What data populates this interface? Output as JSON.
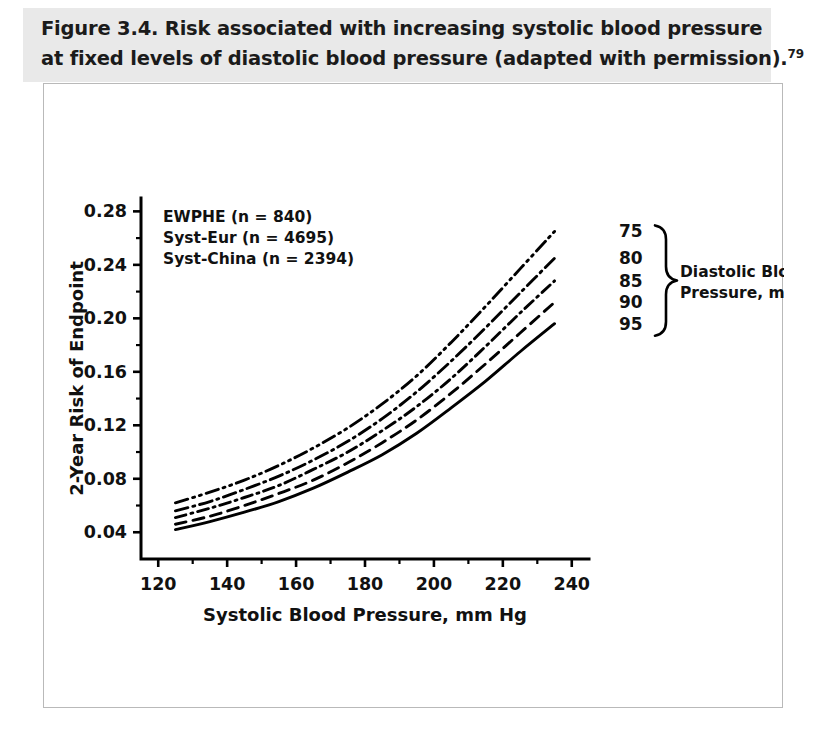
{
  "figure": {
    "title_line1": "Figure 3.4. Risk associated with increasing systolic blood pressure",
    "title_line2": "at fixed levels of diastolic blood pressure (adapted with permission).",
    "title_reference": "79"
  },
  "chart_data": {
    "type": "line",
    "title": "Risk associated with increasing systolic blood pressure at fixed levels of diastolic blood pressure",
    "xlabel": "Systolic Blood Pressure, mm Hg",
    "ylabel": "2-Year Risk of Endpoint",
    "xlim": [
      115,
      245
    ],
    "ylim": [
      0.02,
      0.29
    ],
    "xticks": [
      120,
      140,
      160,
      180,
      200,
      220,
      240
    ],
    "xtick_labels": [
      "120",
      "140",
      "160",
      "180",
      "200",
      "220",
      "240"
    ],
    "yticks": [
      0.04,
      0.08,
      0.12,
      0.16,
      0.2,
      0.24,
      0.28
    ],
    "ytick_labels": [
      "0.04",
      "0.08",
      "0.12",
      "0.16",
      "0.20",
      "0.24",
      "0.28"
    ],
    "grid": false,
    "legend_position": "upper-left",
    "legend_entries": [
      "EWPHE (n = 840)",
      "Syst-Eur (n = 4695)",
      "Syst-China (n = 2394)"
    ],
    "series_group_label_line1": "Diastolic Blood",
    "series_group_label_line2": "Pressure, mm Hg",
    "x": [
      125,
      135,
      145,
      155,
      165,
      175,
      185,
      195,
      205,
      215,
      225,
      235
    ],
    "series": [
      {
        "name": "75",
        "label": "75",
        "linestyle": "dash-dot-dot",
        "values": [
          0.062,
          0.07,
          0.079,
          0.09,
          0.103,
          0.118,
          0.136,
          0.157,
          0.182,
          0.209,
          0.237,
          0.265
        ]
      },
      {
        "name": "80",
        "label": "80",
        "linestyle": "dash-dot",
        "values": [
          0.056,
          0.063,
          0.072,
          0.082,
          0.094,
          0.108,
          0.125,
          0.145,
          0.168,
          0.193,
          0.219,
          0.245
        ]
      },
      {
        "name": "85",
        "label": "85",
        "linestyle": "short-dash-dot",
        "values": [
          0.051,
          0.058,
          0.066,
          0.075,
          0.087,
          0.1,
          0.116,
          0.134,
          0.155,
          0.179,
          0.204,
          0.228
        ]
      },
      {
        "name": "90",
        "label": "90",
        "linestyle": "dashed",
        "values": [
          0.046,
          0.052,
          0.06,
          0.069,
          0.079,
          0.092,
          0.107,
          0.124,
          0.144,
          0.166,
          0.189,
          0.212
        ]
      },
      {
        "name": "95",
        "label": "95",
        "linestyle": "solid",
        "values": [
          0.042,
          0.048,
          0.055,
          0.063,
          0.073,
          0.085,
          0.098,
          0.114,
          0.133,
          0.153,
          0.175,
          0.196
        ]
      }
    ]
  }
}
